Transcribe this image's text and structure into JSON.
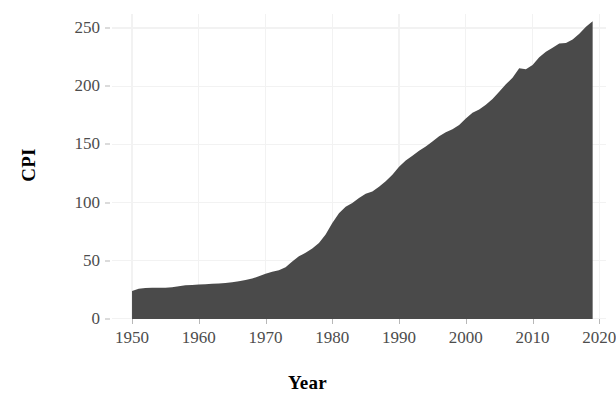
{
  "chart_data": {
    "type": "area",
    "title": "",
    "xlabel": "Year",
    "ylabel": "CPI",
    "xlim": [
      1947,
      2021
    ],
    "ylim": [
      0,
      262
    ],
    "grid": true,
    "legend": "none",
    "fill_color": "#4a4a4a",
    "gridline_color": "#f2f2f2",
    "background_color": "#ffffff",
    "tick_label_color": "#4d4d4d",
    "axis_title_color": "#000000",
    "x_ticks": [
      1950,
      1960,
      1970,
      1980,
      1990,
      2000,
      2010,
      2020
    ],
    "x_tick_labels": [
      "1950",
      "1960",
      "1970",
      "1980",
      "1990",
      "2000",
      "2010",
      "2020"
    ],
    "y_ticks": [
      0,
      50,
      100,
      150,
      200,
      250
    ],
    "y_tick_labels": [
      "0",
      "50",
      "100",
      "150",
      "200",
      "250"
    ],
    "series": [
      {
        "name": "CPI",
        "x": [
          1950,
          1951,
          1952,
          1953,
          1954,
          1955,
          1956,
          1957,
          1958,
          1959,
          1960,
          1961,
          1962,
          1963,
          1964,
          1965,
          1966,
          1967,
          1968,
          1969,
          1970,
          1971,
          1972,
          1973,
          1974,
          1975,
          1976,
          1977,
          1978,
          1979,
          1980,
          1981,
          1982,
          1983,
          1984,
          1985,
          1986,
          1987,
          1988,
          1989,
          1990,
          1991,
          1992,
          1993,
          1994,
          1995,
          1996,
          1997,
          1998,
          1999,
          2000,
          2001,
          2002,
          2003,
          2004,
          2005,
          2006,
          2007,
          2008,
          2009,
          2010,
          2011,
          2012,
          2013,
          2014,
          2015,
          2016,
          2017,
          2018,
          2019
        ],
        "values": [
          24.1,
          26.0,
          26.6,
          26.8,
          26.9,
          26.8,
          27.2,
          28.1,
          28.9,
          29.2,
          29.6,
          29.9,
          30.3,
          30.6,
          31.0,
          31.5,
          32.5,
          33.4,
          34.8,
          36.7,
          38.8,
          40.5,
          41.8,
          44.4,
          49.3,
          53.8,
          56.9,
          60.6,
          65.2,
          72.6,
          82.4,
          90.9,
          96.5,
          99.6,
          103.9,
          107.6,
          109.6,
          113.6,
          118.3,
          124.0,
          130.7,
          136.2,
          140.3,
          144.5,
          148.2,
          152.4,
          156.9,
          160.5,
          163.0,
          166.6,
          172.2,
          177.1,
          179.9,
          184.0,
          188.9,
          195.3,
          201.6,
          207.3,
          215.3,
          214.5,
          218.1,
          224.9,
          229.6,
          233.0,
          236.7,
          237.0,
          240.0,
          245.1,
          251.1,
          255.7
        ]
      }
    ]
  }
}
